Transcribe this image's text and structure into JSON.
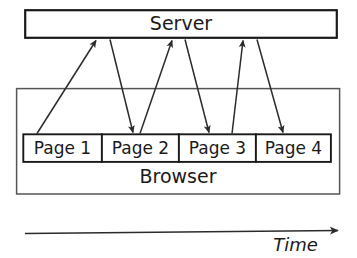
{
  "diagram": {
    "type": "sequence-flow",
    "server": {
      "label": "Server",
      "box": {
        "x": 25,
        "y": 10,
        "width": 312,
        "height": 28
      }
    },
    "browser": {
      "label": "Browser",
      "box": {
        "x": 16,
        "y": 88,
        "width": 324,
        "height": 106
      },
      "pages": [
        {
          "label": "Page 1",
          "x": 23,
          "y": 134,
          "width": 79,
          "height": 28
        },
        {
          "label": "Page 2",
          "x": 102,
          "y": 134,
          "width": 77,
          "height": 28
        },
        {
          "label": "Page 3",
          "x": 179,
          "y": 134,
          "width": 77,
          "height": 28
        },
        {
          "label": "Page 4",
          "x": 256,
          "y": 134,
          "width": 75,
          "height": 28
        }
      ]
    },
    "arrows": [
      {
        "name": "request-1",
        "direction": "up",
        "from_x": 37,
        "from_y": 134,
        "to_x": 96,
        "to_y": 39
      },
      {
        "name": "response-1",
        "direction": "down",
        "from_x": 110,
        "from_y": 39,
        "to_x": 133,
        "to_y": 133
      },
      {
        "name": "request-2",
        "direction": "up",
        "from_x": 140,
        "from_y": 134,
        "to_x": 172,
        "to_y": 39
      },
      {
        "name": "response-2",
        "direction": "down",
        "from_x": 185,
        "from_y": 39,
        "to_x": 209,
        "to_y": 133
      },
      {
        "name": "request-3",
        "direction": "up",
        "from_x": 232,
        "from_y": 134,
        "to_x": 243,
        "to_y": 39
      },
      {
        "name": "response-3",
        "direction": "down",
        "from_x": 257,
        "from_y": 39,
        "to_x": 283,
        "to_y": 133
      }
    ],
    "time_axis": {
      "label": "Time",
      "from_x": 25,
      "to_x": 341,
      "y": 233
    },
    "colors": {
      "stroke": "#1a1a1a",
      "line": "#2b2b2b",
      "fill": "#ffffff",
      "background": "#ffffff"
    }
  }
}
